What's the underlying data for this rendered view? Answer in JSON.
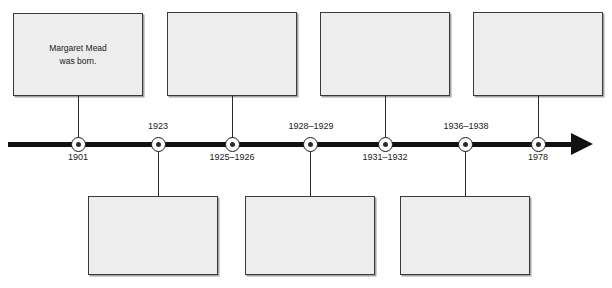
{
  "figure": {
    "type": "timeline",
    "orientation": "horizontal",
    "direction": "left-to-right",
    "arrow_icon": "arrow-right-icon",
    "marker_icon": "circle-dot-marker-icon"
  },
  "timeline": {
    "events": [
      {
        "id": "event-1901",
        "date_label": "1901",
        "date_position": "below-axis",
        "marker_x": 78,
        "box_position": "above",
        "box_text": "Margaret Mead\nwas born."
      },
      {
        "id": "event-1923",
        "date_label": "1923",
        "date_position": "above-axis",
        "marker_x": 158,
        "box_position": "below",
        "box_text": ""
      },
      {
        "id": "event-1925-1926",
        "date_label": "1925–1926",
        "date_position": "below-axis",
        "marker_x": 232,
        "box_position": "above",
        "box_text": ""
      },
      {
        "id": "event-1928-1929",
        "date_label": "1928–1929",
        "date_position": "above-axis",
        "marker_x": 310,
        "box_position": "below",
        "box_text": ""
      },
      {
        "id": "event-1931-1932",
        "date_label": "1931–1932",
        "date_position": "below-axis",
        "marker_x": 385,
        "box_position": "above",
        "box_text": ""
      },
      {
        "id": "event-1936-1938",
        "date_label": "1936–1938",
        "date_position": "above-axis",
        "marker_x": 465,
        "box_position": "below",
        "box_text": ""
      },
      {
        "id": "event-1978",
        "date_label": "1978",
        "date_position": "below-axis",
        "marker_x": 538,
        "box_position": "above",
        "box_text": ""
      }
    ]
  },
  "colors": {
    "axis": "#111111",
    "box_fill": "#ededed",
    "box_border": "#3a3a3a",
    "stem": "#2b2b2b",
    "text": "#1a1a1a",
    "background": "#ffffff"
  }
}
